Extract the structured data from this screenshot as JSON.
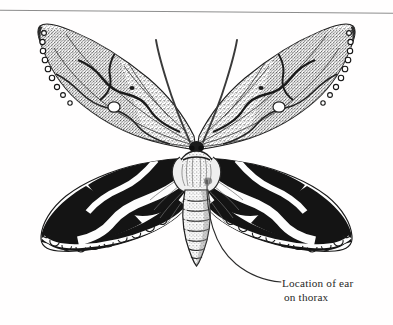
{
  "figure": {
    "style": "stipple-engraving",
    "background_color": "#fffefe",
    "ink_color": "#1a1a1a"
  },
  "top_rule": {
    "present": true,
    "color": "#8d8d8d",
    "left_y": 10,
    "right_y": 13
  },
  "annotation": {
    "label_line_1": "Location of ear",
    "label_line_2": "on thorax",
    "text_color": "#262626",
    "leader_line_color": "#2b2b2b",
    "leader_start_x": 207,
    "leader_start_y": 180,
    "leader_end_x": 281,
    "leader_end_y": 282
  },
  "anatomy": {
    "forewing_left": "stippled-grey-scalloped-forewing",
    "forewing_right": "stippled-grey-scalloped-forewing",
    "hindwing_left": "black-banded-white-zigzag-hindwing",
    "hindwing_right": "black-banded-white-zigzag-hindwing",
    "thorax": "furry-pale-thorax",
    "abdomen": "segmented-tapered-abdomen",
    "antenna_left": "curved-filiform-antenna",
    "antenna_right": "curved-filiform-antenna",
    "eyespot_left": "white-reniform-spot",
    "eyespot_right": "white-reniform-spot"
  },
  "colors": {
    "wing_fill_light": "#c9c9c9",
    "wing_fill_mid": "#9a9a9a",
    "wing_dark": "#151515",
    "wing_white": "#fdfdfd",
    "vein": "#2a2a2a",
    "body_light": "#e2e2e2",
    "body_mid": "#a0a0a0"
  }
}
